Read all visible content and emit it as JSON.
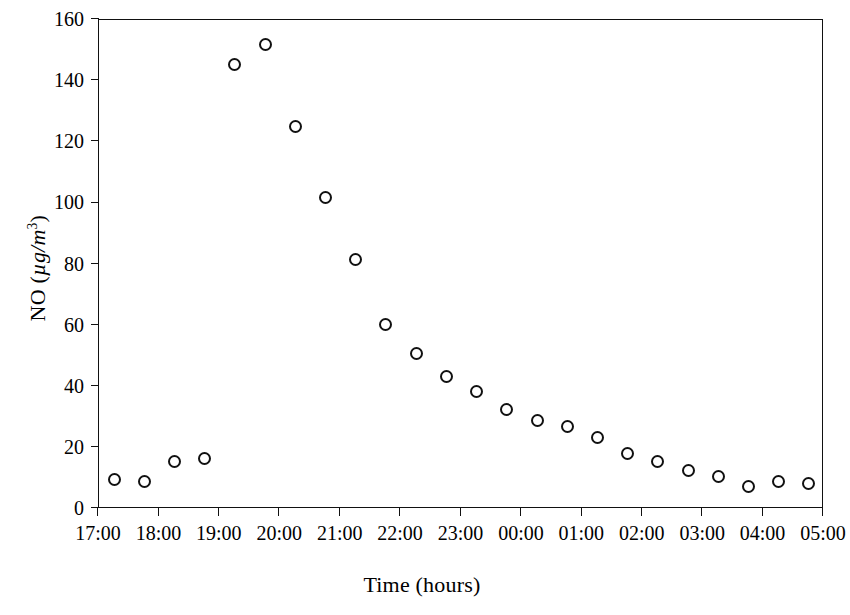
{
  "chart_data": {
    "type": "scatter",
    "title": "",
    "xlabel": "Time (hours)",
    "ylabel": "NO (µg/m³)",
    "ylabel_parts": {
      "species": "NO",
      "open": " (",
      "unit_italic": "µg/m",
      "exponent": "3",
      "close": ")"
    },
    "grid": false,
    "legend": false,
    "xlim_hours": [
      17,
      29
    ],
    "ylim": [
      0,
      160
    ],
    "xticks": [
      "17:00",
      "18:00",
      "19:00",
      "20:00",
      "21:00",
      "22:00",
      "23:00",
      "00:00",
      "01:00",
      "02:00",
      "03:00",
      "04:00",
      "05:00"
    ],
    "xtick_hours": [
      17,
      18,
      19,
      20,
      21,
      22,
      23,
      24,
      25,
      26,
      27,
      28,
      29
    ],
    "yticks": [
      0,
      20,
      40,
      60,
      80,
      100,
      120,
      140,
      160
    ],
    "x_times": [
      "17:15",
      "17:45",
      "18:15",
      "18:45",
      "19:15",
      "19:45",
      "20:15",
      "20:45",
      "21:15",
      "21:45",
      "22:15",
      "22:45",
      "23:15",
      "23:45",
      "00:15",
      "00:45",
      "01:15",
      "01:45",
      "02:15",
      "02:45",
      "03:15",
      "03:45",
      "04:15",
      "04:45"
    ],
    "x_hours": [
      17.25,
      17.75,
      18.25,
      18.75,
      19.25,
      19.75,
      20.25,
      20.75,
      21.25,
      21.75,
      22.25,
      22.75,
      23.25,
      23.75,
      24.25,
      24.75,
      25.25,
      25.75,
      26.25,
      26.75,
      27.25,
      27.75,
      28.25,
      28.75
    ],
    "values": [
      9.5,
      9.0,
      15.5,
      16.5,
      145.5,
      152.0,
      125.0,
      102.0,
      81.5,
      60.5,
      51.0,
      43.5,
      38.5,
      32.5,
      29.0,
      27.0,
      23.5,
      18.0,
      15.5,
      12.5,
      10.5,
      7.5,
      9.0,
      8.5
    ],
    "marker": {
      "shape": "open-circle",
      "color": "#111111",
      "size_px": 13
    },
    "axis_color": "#111111",
    "background": "#ffffff"
  }
}
